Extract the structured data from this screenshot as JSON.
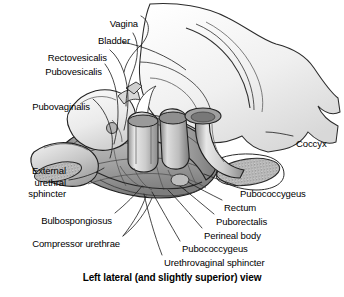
{
  "figure": {
    "caption": "Left lateral (and slightly superior) view",
    "view_name": "Left lateral (and slightly superior) view",
    "style": "grayscale medical illustration",
    "width": 344,
    "height": 297,
    "colors": {
      "background": "#ffffff",
      "line": "#1a1a1a",
      "fill_light": "#f2f2f2",
      "fill_mid": "#d9d9d9",
      "fill_dark": "#a8a8a8",
      "stipple": "#6e6e6e",
      "text": "#000000"
    }
  },
  "labels": [
    {
      "id": "vagina",
      "text": "Vagina",
      "align": "right",
      "x": 138,
      "y": 18
    },
    {
      "id": "bladder",
      "text": "Bladder",
      "align": "right",
      "x": 130,
      "y": 35
    },
    {
      "id": "rectovesicalis",
      "text": "Rectovesicalis",
      "align": "right",
      "x": 107,
      "y": 52
    },
    {
      "id": "pubovesicalis",
      "text": "Pubovesicalis",
      "align": "right",
      "x": 102,
      "y": 66
    },
    {
      "id": "pubovaginalis",
      "text": "Pubovaginalis",
      "align": "right",
      "x": 90,
      "y": 101
    },
    {
      "id": "external-urethral-sphincter",
      "text": "External\nurethral\nsphincter",
      "align": "right",
      "x": 66,
      "y": 165
    },
    {
      "id": "bulbospongiosus",
      "text": "Bulbospongiosus",
      "align": "right",
      "x": 112,
      "y": 215
    },
    {
      "id": "compressor-urethrae",
      "text": "Compressor urethrae",
      "align": "right",
      "x": 120,
      "y": 238
    },
    {
      "id": "coccyx",
      "text": "Coccyx",
      "align": "left",
      "x": 296,
      "y": 138
    },
    {
      "id": "pubococcygeus-upper",
      "text": "Pubococcygeus",
      "align": "left",
      "x": 240,
      "y": 188
    },
    {
      "id": "rectum",
      "text": "Rectum",
      "align": "left",
      "x": 224,
      "y": 202
    },
    {
      "id": "puborectalis",
      "text": "Puborectalis",
      "align": "left",
      "x": 216,
      "y": 216
    },
    {
      "id": "perineal-body",
      "text": "Perineal body",
      "align": "left",
      "x": 204,
      "y": 230
    },
    {
      "id": "pubococcygeus-lower",
      "text": "Pubococcygeus",
      "align": "left",
      "x": 182,
      "y": 243
    },
    {
      "id": "urethrovaginal-sphincter",
      "text": "Urethrovaginal sphincter",
      "align": "left",
      "x": 164,
      "y": 257
    }
  ],
  "structures": [
    {
      "id": "sacrum",
      "name": "Sacrum and pelvic bone"
    },
    {
      "id": "coccyx-bone",
      "name": "Coccyx"
    },
    {
      "id": "bladder-body",
      "name": "Bladder"
    },
    {
      "id": "vagina-tube",
      "name": "Vagina"
    },
    {
      "id": "urethra-tube",
      "name": "Urethra"
    },
    {
      "id": "rectum-tube",
      "name": "Rectum"
    },
    {
      "id": "levator-ani-sling",
      "name": "Levator ani muscle sling"
    },
    {
      "id": "perineal-membrane",
      "name": "Perineal membrane"
    }
  ]
}
